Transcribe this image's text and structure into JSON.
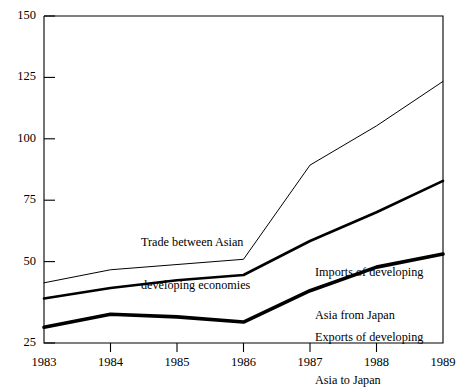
{
  "chart_data": {
    "type": "line",
    "title": "",
    "subtitle": "",
    "xlabel": "",
    "ylabel": "",
    "x": [
      1983,
      1984,
      1985,
      1986,
      1987,
      1988,
      1989
    ],
    "xlim": [
      1983,
      1989
    ],
    "ylim": [
      25,
      150
    ],
    "grid": false,
    "legend_position": "inline-annotations",
    "yticks": [
      25,
      50,
      75,
      100,
      125,
      150
    ],
    "ytick_labels": [
      "25",
      "50",
      "75",
      "100",
      "125",
      "150"
    ],
    "xticks": [
      1983,
      1984,
      1985,
      1986,
      1987,
      1988,
      1989
    ],
    "xtick_labels": [
      "1983",
      "1984",
      "1985",
      "1986",
      "1987",
      "1988",
      "1989"
    ],
    "series": [
      {
        "name": "Trade between Asian developing economies",
        "label_lines": [
          "Trade between Asian",
          "developing economies"
        ],
        "values": [
          48,
          53,
          55,
          57,
          93,
          108,
          125
        ],
        "line_width": 1.0,
        "color": "#000000"
      },
      {
        "name": "Imports of developing Asia from Japan",
        "label_lines": [
          "Imports of developing",
          "Asia from Japan"
        ],
        "values": [
          42,
          46,
          49,
          51,
          64,
          75,
          87
        ],
        "line_width": 2.6,
        "color": "#000000"
      },
      {
        "name": "Exports of developing Asia to Japan",
        "label_lines": [
          "Exports of developing",
          "Asia to Japan"
        ],
        "values": [
          31,
          36,
          35,
          33,
          45,
          54,
          59
        ],
        "line_width": 3.6,
        "color": "#000000"
      }
    ]
  },
  "annotations": {
    "trade_between": {
      "line1": "Trade between Asian",
      "line2": "developing economies"
    },
    "imports": {
      "line1": "Imports of developing",
      "line2": "Asia from Japan"
    },
    "exports": {
      "line1": "Exports of developing",
      "line2": "Asia to Japan"
    }
  },
  "y_axis": {
    "t150": "150",
    "t125": "125",
    "t100": "100",
    "t75": "75",
    "t50": "50",
    "t25": "25"
  },
  "x_axis": {
    "t1983": "1983",
    "t1984": "1984",
    "t1985": "1985",
    "t1986": "1986",
    "t1987": "1987",
    "t1988": "1988",
    "t1989": "1989"
  },
  "colors": {
    "axis": "#000000",
    "series": "#000000",
    "background": "#ffffff"
  }
}
